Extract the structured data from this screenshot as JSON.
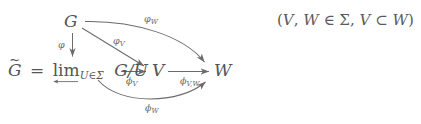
{
  "figure": {
    "type": "commutative-diagram",
    "background_color": "#ffffff",
    "ink_color": "#5a5a5a",
    "nodes": {
      "g": "G",
      "g_tilde_eq": "G",
      "equals": "=",
      "lim": "lim",
      "lim_subscript": "U∈Σ",
      "g_mod_u": "G/U",
      "v": "V",
      "w": "W"
    },
    "arrow_labels": {
      "phi": "φ",
      "varphi_v": "φ",
      "varphi_v_sub": "V",
      "varphi_w": "φ",
      "varphi_w_sub": "W",
      "phi_v": "ϕ",
      "phi_v_sub": "V",
      "phi_vw": "ϕ",
      "phi_vw_sub": "V,W",
      "phi_w": "ϕ",
      "phi_w_sub": "W"
    },
    "annotation": {
      "open_paren": "(",
      "v": "V",
      "comma1": ",",
      "w": "W",
      "in": "∈",
      "sigma": "Σ",
      "comma2": ",",
      "v2": "V",
      "subset": "⊂",
      "w2": "W",
      "close_paren": ")"
    }
  }
}
